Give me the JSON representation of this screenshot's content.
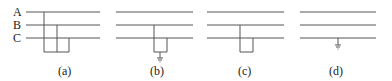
{
  "phase_labels": [
    "A",
    "B",
    "C"
  ],
  "panels": [
    {
      "caption": "(a)",
      "description": "Three-phase short circuit A-B-C (no ground)"
    },
    {
      "caption": "(b)",
      "description": "Two-phase short circuit B-C to ground"
    },
    {
      "caption": "(c)",
      "description": "Two-phase short circuit B-C"
    },
    {
      "caption": "(d)",
      "description": "Single-phase C to ground"
    }
  ],
  "colors": {
    "line": "#555555",
    "text": "#222222"
  }
}
